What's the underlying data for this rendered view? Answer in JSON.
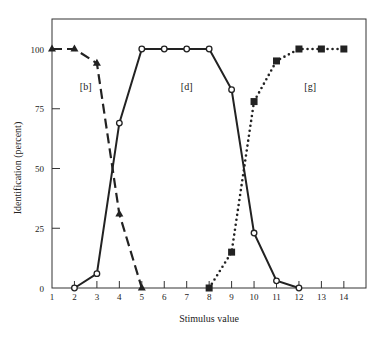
{
  "chart_data": {
    "type": "line",
    "title": "",
    "xlabel": "Stimulus value",
    "ylabel": "Identification (percent)",
    "xlim": [
      1,
      14
    ],
    "ylim": [
      0,
      100
    ],
    "x_ticks": [
      1,
      2,
      3,
      4,
      5,
      6,
      7,
      8,
      9,
      10,
      11,
      12,
      13,
      14
    ],
    "y_ticks": [
      0,
      25,
      50,
      75,
      100
    ],
    "grid": false,
    "legend": "none (curves labeled in-plot)",
    "annotations": [
      {
        "text": "[b]",
        "x": 2.5,
        "y": 83
      },
      {
        "text": "[d]",
        "x": 7,
        "y": 83
      },
      {
        "text": "[g]",
        "x": 12.5,
        "y": 83
      }
    ],
    "series": [
      {
        "name": "[b]",
        "marker": "filled-triangle",
        "line": "dashed",
        "x": [
          1,
          2,
          3,
          4,
          5
        ],
        "values": [
          100,
          100,
          94,
          31,
          0
        ]
      },
      {
        "name": "[d]",
        "marker": "open-circle",
        "line": "solid",
        "x": [
          2,
          3,
          4,
          5,
          6,
          7,
          8,
          9,
          10,
          11,
          12
        ],
        "values": [
          0,
          6,
          69,
          100,
          100,
          100,
          100,
          83,
          23,
          3,
          0
        ]
      },
      {
        "name": "[g]",
        "marker": "filled-square",
        "line": "dotted",
        "x": [
          8,
          9,
          10,
          11,
          12,
          13,
          14
        ],
        "values": [
          0,
          15,
          78,
          95,
          100,
          100,
          100
        ]
      }
    ]
  }
}
